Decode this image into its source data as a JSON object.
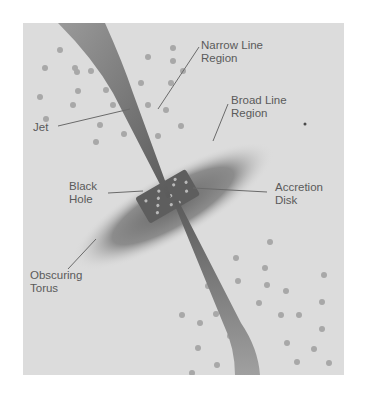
{
  "diagram": {
    "labels": {
      "narrow_line_region": [
        "Narrow Line",
        "Region"
      ],
      "broad_line_region": [
        "Broad Line",
        "Region"
      ],
      "jet": "Jet",
      "black_hole": [
        "Black",
        "Hole"
      ],
      "accretion_disk": [
        "Accretion",
        "Disk"
      ],
      "obscuring_torus": [
        "Obscuring",
        "Torus"
      ]
    },
    "colors": {
      "background": "#dcdcdc",
      "jet": "#6e6e6e",
      "torus": "#8a8a8a",
      "clouds": "#a4a4a4",
      "text": "#5a5a5a"
    }
  }
}
